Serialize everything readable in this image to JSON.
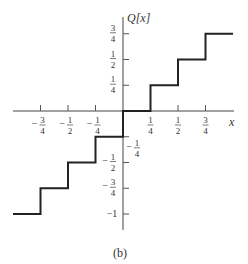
{
  "chart_data": {
    "type": "line",
    "subtype": "staircase-quantizer",
    "title": "",
    "caption": "(b)",
    "xlabel": "x",
    "ylabel": "Q[x]",
    "xlim": [
      -1,
      1
    ],
    "ylim": [
      -1,
      0.75
    ],
    "grid": false,
    "legend": null,
    "x_ticks": [
      {
        "value": -0.75,
        "label_num": "3",
        "label_den": "4",
        "sign": "−"
      },
      {
        "value": -0.5,
        "label_num": "1",
        "label_den": "2",
        "sign": "−"
      },
      {
        "value": -0.25,
        "label_num": "1",
        "label_den": "4",
        "sign": "−"
      },
      {
        "value": 0.25,
        "label_num": "1",
        "label_den": "4",
        "sign": ""
      },
      {
        "value": 0.5,
        "label_num": "1",
        "label_den": "2",
        "sign": ""
      },
      {
        "value": 0.75,
        "label_num": "3",
        "label_den": "4",
        "sign": ""
      }
    ],
    "y_ticks": [
      {
        "value": 0.75,
        "label_num": "3",
        "label_den": "4",
        "sign": ""
      },
      {
        "value": 0.5,
        "label_num": "1",
        "label_den": "2",
        "sign": ""
      },
      {
        "value": 0.25,
        "label_num": "1",
        "label_den": "4",
        "sign": ""
      },
      {
        "value": -0.25,
        "label_num": "1",
        "label_den": "4",
        "sign": "−"
      },
      {
        "value": -0.5,
        "label_num": "1",
        "label_den": "2",
        "sign": "−"
      },
      {
        "value": -0.75,
        "label_num": "3",
        "label_den": "4",
        "sign": "−"
      },
      {
        "value": -1,
        "label_text": "−1"
      }
    ],
    "series": [
      {
        "name": "Q[x]",
        "steps": [
          {
            "x_from": -1.0,
            "x_to": -0.75,
            "y": -1.0
          },
          {
            "x_from": -0.75,
            "x_to": -0.5,
            "y": -0.75
          },
          {
            "x_from": -0.5,
            "x_to": -0.25,
            "y": -0.5
          },
          {
            "x_from": -0.25,
            "x_to": 0.0,
            "y": -0.25
          },
          {
            "x_from": 0.0,
            "x_to": 0.25,
            "y": 0.0
          },
          {
            "x_from": 0.25,
            "x_to": 0.5,
            "y": 0.25
          },
          {
            "x_from": 0.5,
            "x_to": 0.75,
            "y": 0.5
          },
          {
            "x_from": 0.75,
            "x_to": 1.0,
            "y": 0.75
          }
        ]
      }
    ]
  },
  "labels": {
    "y_axis": "Q[x]",
    "x_axis": "x",
    "caption": "(b)"
  }
}
